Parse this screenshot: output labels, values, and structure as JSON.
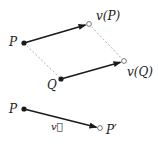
{
  "diagram": {
    "colors": {
      "stroke": "#1a1a1a",
      "dashed": "#999999",
      "background": "#ffffff"
    },
    "top": {
      "points": {
        "P": {
          "label": "P",
          "x": 24,
          "y": 43,
          "filled": true
        },
        "Q": {
          "label": "Q",
          "x": 61,
          "y": 79,
          "filled": true
        },
        "vP": {
          "label": "v(P)",
          "x": 89,
          "y": 24,
          "filled": false
        },
        "vQ": {
          "label": "v(Q)",
          "x": 124,
          "y": 61,
          "filled": false
        }
      },
      "arrows": [
        {
          "from": "P",
          "to": "vP"
        },
        {
          "from": "Q",
          "to": "vQ"
        }
      ],
      "dashed_lines": [
        {
          "from": "P",
          "to": "Q"
        },
        {
          "from": "vP",
          "to": "vQ"
        }
      ]
    },
    "bottom": {
      "points": {
        "P": {
          "label": "P",
          "x": 24,
          "y": 109,
          "filled": true
        },
        "Pprime": {
          "label": "P′",
          "x": 100,
          "y": 128,
          "filled": false
        }
      },
      "vector_label": "v⃗"
    }
  }
}
